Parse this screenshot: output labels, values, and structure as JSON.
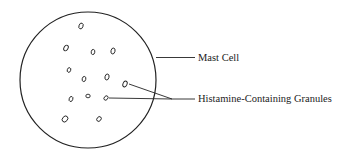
{
  "diagram": {
    "labels": {
      "cell": "Mast Cell",
      "granules": "Histamine-Containing Granules"
    },
    "cell": {
      "cx": 88,
      "cy": 80,
      "r": 68
    },
    "granules": [
      {
        "x": 81,
        "y": 26
      },
      {
        "x": 66,
        "y": 48
      },
      {
        "x": 93,
        "y": 52
      },
      {
        "x": 113,
        "y": 51
      },
      {
        "x": 69,
        "y": 70
      },
      {
        "x": 84,
        "y": 79
      },
      {
        "x": 107,
        "y": 77
      },
      {
        "x": 125,
        "y": 84
      },
      {
        "x": 71,
        "y": 99
      },
      {
        "x": 88,
        "y": 96
      },
      {
        "x": 106,
        "y": 98
      },
      {
        "x": 65,
        "y": 119
      },
      {
        "x": 99,
        "y": 119
      }
    ],
    "colors": {
      "stroke": "#222222",
      "background": "#ffffff"
    }
  }
}
